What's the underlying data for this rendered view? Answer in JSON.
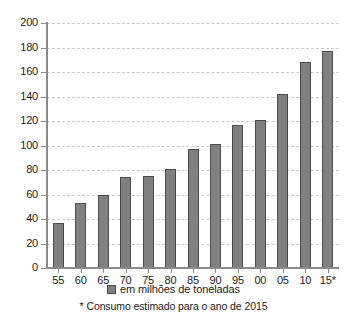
{
  "chart_data": {
    "type": "bar",
    "title": "",
    "subtitle": "",
    "xlabel": "",
    "ylabel": "",
    "categories": [
      "55",
      "60",
      "65",
      "70",
      "75",
      "80",
      "85",
      "90",
      "95",
      "00",
      "05",
      "10",
      "15*"
    ],
    "values": [
      37,
      53,
      60,
      74,
      75,
      81,
      97,
      101,
      117,
      121,
      142,
      168,
      177
    ],
    "series": [
      {
        "name": "em milhões de toneladas",
        "values": [
          37,
          53,
          60,
          74,
          75,
          81,
          97,
          101,
          117,
          121,
          142,
          168,
          177
        ]
      }
    ],
    "ylim": [
      0,
      200
    ],
    "ytick_labels": [
      "0",
      "20",
      "40",
      "60",
      "80",
      "100",
      "120",
      "140",
      "160",
      "180",
      "200"
    ],
    "ytick_values": [
      0,
      20,
      40,
      60,
      80,
      100,
      120,
      140,
      160,
      180,
      200
    ],
    "grid": true,
    "grid_axis": "y",
    "legend_position": "bottom",
    "legend_entries": [
      "em milhões de toneladas"
    ],
    "annotations": [
      "* Consumo estimado para o ano de 2015"
    ],
    "bar_color": "#808080",
    "bar_border_color": "#4d4d4d",
    "grid_color": "#c9c9c9",
    "axis_color": "#8a8a8a"
  },
  "legend": {
    "swatch_name": "legend-color-swatch",
    "label": "em milhões de toneladas"
  },
  "footnote": {
    "text": "* Consumo estimado para o ano de 2015"
  }
}
